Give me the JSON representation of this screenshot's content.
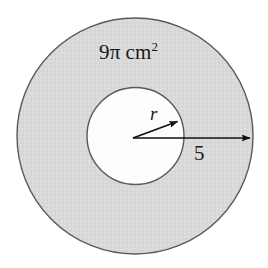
{
  "figure": {
    "type": "annulus-diagram",
    "background_color": "#ffffff",
    "ring_fill_color": "#d9d9d9",
    "hole_fill_color": "#ffffff",
    "stroke_color": "#555555",
    "arrow_color": "#111111",
    "outer_circle": {
      "cx": 135,
      "cy": 136,
      "r": 118
    },
    "inner_circle": {
      "cx": 135.5,
      "cy": 136,
      "r": 48.5
    },
    "labels": {
      "area": {
        "coefficient": "9",
        "pi": "π",
        "unit": "cm",
        "exponent": "2",
        "full_text": "9π cm²"
      },
      "inner_radius": "r",
      "outer_radius": "5"
    },
    "arrows": {
      "inner_radius_arrow": {
        "from": [
          133,
          138
        ],
        "to": [
          179,
          121
        ],
        "label": "r"
      },
      "outer_radius_arrow": {
        "from": [
          133,
          138
        ],
        "to": [
          252,
          138
        ],
        "label": "5"
      }
    }
  }
}
